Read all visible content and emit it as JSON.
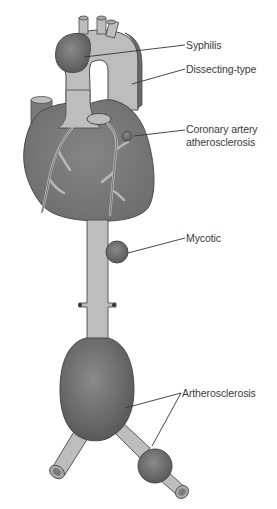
{
  "figure": {
    "colors": {
      "vessel_fill": "#bdbdbd",
      "heart_fill": "#7a7a7a",
      "aneurysm_fill": "#6e6e6e",
      "outline": "#4a4a4a",
      "leader_line": "#333333",
      "label_text": "#3a3a3a",
      "background": "#ffffff"
    }
  },
  "labels": [
    {
      "id": "syphilis",
      "text": "Syphilis"
    },
    {
      "id": "dissecting",
      "text": "Dissecting-type"
    },
    {
      "id": "coronary_line1",
      "text": "Coronary artery"
    },
    {
      "id": "coronary_line2",
      "text": "atherosclerosis"
    },
    {
      "id": "mycotic",
      "text": "Mycotic"
    },
    {
      "id": "artherosclerosis",
      "text": "Artherosclerosis"
    }
  ]
}
